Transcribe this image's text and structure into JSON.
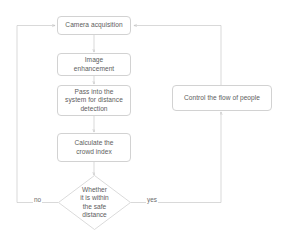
{
  "diagram": {
    "type": "flowchart",
    "colors": {
      "background": "#ffffff",
      "node_border": "#d2d2d2",
      "node_fill": "#ffffff",
      "text": "#5d5d5d",
      "edge_line": "#c9c9c9",
      "edge_label_text": "#6a6a6a"
    },
    "nodes": [
      {
        "id": "camera-acquisition",
        "shape": "rounded-rect",
        "label": "Camera acquisition"
      },
      {
        "id": "image-enhancement",
        "shape": "rounded-rect",
        "label": "Image\nenhancement"
      },
      {
        "id": "pass-into-system",
        "shape": "rounded-rect",
        "label": "Pass into the\nsystem for distance\ndetection"
      },
      {
        "id": "calculate-crowd-index",
        "shape": "rounded-rect",
        "label": "Calculate the\ncrowd index"
      },
      {
        "id": "safe-distance-decision",
        "shape": "diamond",
        "label": "Whether\nit is within\nthe safe\ndistance"
      },
      {
        "id": "control-flow-of-people",
        "shape": "rounded-rect",
        "label": "Control the flow of people"
      }
    ],
    "edge_labels": {
      "no": "no",
      "yes": "yes"
    }
  }
}
